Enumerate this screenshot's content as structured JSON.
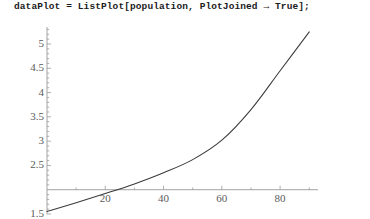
{
  "code": {
    "text": "dataPlot = ListPlot[population, PlotJoined → True];"
  },
  "chart_data": {
    "type": "line",
    "title": "",
    "xlabel": "",
    "ylabel": "",
    "xlim": [
      0,
      93
    ],
    "ylim": [
      1.5,
      5.35
    ],
    "grid": false,
    "legend": null,
    "line_color": "#3a3a3a",
    "axis_color": "#9a9a9a",
    "x_axis_crossing_y": 2,
    "x_ticks": [
      20,
      40,
      60,
      80
    ],
    "x_tick_labels": [
      "20",
      "40",
      "60",
      "80"
    ],
    "x_minor_ticks": [
      10,
      30,
      50,
      70,
      90
    ],
    "y_ticks": [
      1.5,
      2.5,
      3,
      3.5,
      4,
      4.5,
      5
    ],
    "y_tick_labels": [
      "1.5",
      "2.5",
      "3",
      "3.5",
      "4",
      "4.5",
      "5"
    ],
    "y_minor_ticks": [
      1.6,
      1.7,
      1.8,
      1.9,
      2.1,
      2.2,
      2.3,
      2.4,
      2.6,
      2.7,
      2.8,
      2.9,
      3.1,
      3.2,
      3.3,
      3.4,
      3.6,
      3.7,
      3.8,
      3.9,
      4.1,
      4.2,
      4.3,
      4.4,
      4.6,
      4.7,
      4.8,
      4.9,
      5.1,
      5.2,
      5.3
    ],
    "series": [
      {
        "name": "population",
        "x": [
          0,
          10,
          20,
          30,
          40,
          50,
          60,
          70,
          80,
          90
        ],
        "y": [
          1.55,
          1.73,
          1.92,
          2.12,
          2.35,
          2.62,
          3.02,
          3.65,
          4.45,
          5.25
        ]
      }
    ]
  }
}
